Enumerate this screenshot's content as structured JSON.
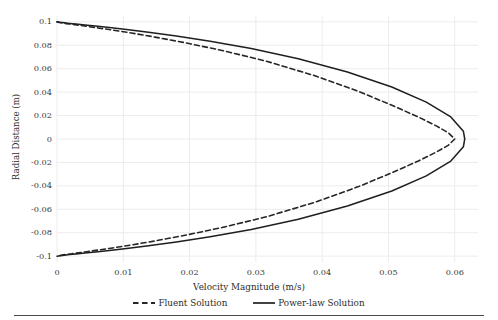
{
  "chart_data": {
    "type": "line",
    "title": "",
    "xlabel": "Velocity Magnitude (m/s)",
    "ylabel": "Radial Distance (m)",
    "xlim": [
      0,
      0.0635
    ],
    "ylim": [
      -0.105,
      0.105
    ],
    "xticks": [
      0,
      0.01,
      0.02,
      0.03,
      0.04,
      0.05,
      0.06
    ],
    "xtick_labels": [
      "0",
      "0.01",
      "0.02",
      "0.03",
      "0.04",
      "0.05",
      "0.06"
    ],
    "yticks": [
      0.1,
      0.08,
      0.06,
      0.04,
      0.02,
      0,
      -0.02,
      -0.04,
      -0.06,
      -0.08,
      -0.1
    ],
    "ytick_labels": [
      "0.1",
      "0.08",
      "0.06",
      "0.04",
      "0.02",
      "0",
      "-0.02",
      "-0.04",
      "-0.06",
      "-0.08",
      "-0.1"
    ],
    "grid": true,
    "grid_color": "#ececec",
    "legend_position": "below-axes",
    "series": [
      {
        "name": "Fluent Solution",
        "linestyle": "dashed",
        "color": "#262626",
        "linewidth": 1.6,
        "x": [
          0.0,
          0.00035,
          0.0008,
          0.0014,
          0.0022,
          0.0032,
          0.0045,
          0.0062,
          0.0084,
          0.0112,
          0.0148,
          0.0193,
          0.0249,
          0.0316,
          0.0389,
          0.0455,
          0.0506,
          0.0545,
          0.0572,
          0.059,
          0.06,
          0.059,
          0.0572,
          0.0545,
          0.0506,
          0.0455,
          0.0389,
          0.0316,
          0.0249,
          0.0193,
          0.0148,
          0.0112,
          0.0084,
          0.0062,
          0.0045,
          0.0032,
          0.0022,
          0.0014,
          0.0008,
          0.00035,
          0.0
        ],
        "y": [
          0.1,
          0.0995,
          0.099,
          0.0985,
          0.098,
          0.0972,
          0.0962,
          0.0948,
          0.093,
          0.0905,
          0.087,
          0.0822,
          0.0756,
          0.0664,
          0.054,
          0.0406,
          0.0286,
          0.0188,
          0.0112,
          0.0054,
          0.0,
          -0.0054,
          -0.0112,
          -0.0188,
          -0.0286,
          -0.0406,
          -0.054,
          -0.0664,
          -0.0756,
          -0.0822,
          -0.087,
          -0.0905,
          -0.093,
          -0.0948,
          -0.0962,
          -0.0972,
          -0.098,
          -0.0985,
          -0.099,
          -0.0995,
          -0.1
        ]
      },
      {
        "name": "Power-law Solution",
        "linestyle": "solid",
        "color": "#1f1f1f",
        "linewidth": 1.5,
        "x": [
          0.0,
          0.0005,
          0.0011,
          0.0019,
          0.0029,
          0.0042,
          0.0058,
          0.0079,
          0.0105,
          0.0138,
          0.018,
          0.0231,
          0.0293,
          0.0364,
          0.0438,
          0.0505,
          0.0557,
          0.0594,
          0.0613,
          0.0615,
          0.0613,
          0.0594,
          0.0557,
          0.0505,
          0.0438,
          0.0364,
          0.0293,
          0.0231,
          0.018,
          0.0138,
          0.0105,
          0.0079,
          0.0058,
          0.0042,
          0.0029,
          0.0019,
          0.0011,
          0.0005,
          0.0
        ],
        "y": [
          0.1,
          0.0996,
          0.0992,
          0.0987,
          0.0981,
          0.0973,
          0.0964,
          0.0951,
          0.0934,
          0.0911,
          0.0879,
          0.0834,
          0.0772,
          0.0685,
          0.0572,
          0.0444,
          0.0315,
          0.0188,
          0.0066,
          0.0,
          -0.0066,
          -0.0188,
          -0.0315,
          -0.0444,
          -0.0572,
          -0.0685,
          -0.0772,
          -0.0834,
          -0.0879,
          -0.0911,
          -0.0934,
          -0.0951,
          -0.0964,
          -0.0973,
          -0.0981,
          -0.0987,
          -0.0992,
          -0.0996,
          -0.1
        ]
      }
    ]
  },
  "legend": {
    "entries": [
      {
        "label": "Fluent Solution"
      },
      {
        "label": "Power-law Solution"
      }
    ]
  }
}
